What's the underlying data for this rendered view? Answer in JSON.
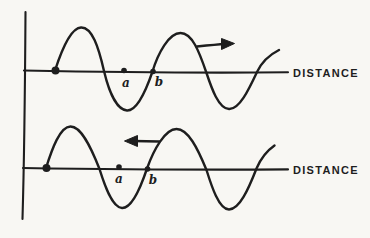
{
  "colors": {
    "ink": "#1e1e1e",
    "paper": "#f8f7f3"
  },
  "figure": {
    "panels": {
      "top": {
        "axis_label": "DISTANCE",
        "motion_direction": "right",
        "points": {
          "a": "a",
          "b": "b"
        }
      },
      "bottom": {
        "axis_label": "DISTANCE",
        "motion_direction": "left",
        "points": {
          "a": "a",
          "b": "b"
        }
      }
    }
  }
}
